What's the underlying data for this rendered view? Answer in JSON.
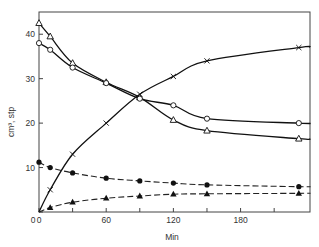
{
  "chart_data": {
    "type": "line",
    "title": "",
    "xlabel": "Min",
    "ylabel": "cm³, stp",
    "xlim": [
      0,
      242
    ],
    "ylim": [
      0,
      45
    ],
    "x_ticks": [
      0,
      30,
      60,
      90,
      120,
      150,
      180,
      210
    ],
    "x_tick_labels": [
      "0",
      "",
      "60",
      "",
      "120",
      "",
      "180",
      ""
    ],
    "y_ticks": [
      0,
      10,
      20,
      30,
      40
    ],
    "y_tick_labels": [
      "",
      "10",
      "20",
      "30",
      "40"
    ],
    "grid": false,
    "legend": null,
    "series": [
      {
        "name": "open-triangle",
        "marker": "triangle-open",
        "line": "solid",
        "x": [
          0,
          10,
          30,
          60,
          90,
          120,
          150,
          232
        ],
        "values": [
          42.5,
          39.5,
          33.5,
          29.2,
          25.8,
          20.7,
          18.3,
          16.5
        ]
      },
      {
        "name": "open-circle",
        "marker": "circle-open",
        "line": "solid",
        "x": [
          0,
          10,
          30,
          60,
          90,
          120,
          150,
          232
        ],
        "values": [
          38.0,
          36.5,
          32.5,
          29.0,
          25.5,
          24.0,
          21.0,
          20.0
        ]
      },
      {
        "name": "cross",
        "marker": "x",
        "line": "solid",
        "x": [
          0,
          10,
          30,
          60,
          90,
          120,
          150,
          232
        ],
        "values": [
          0,
          5.0,
          13.0,
          20.0,
          26.5,
          30.5,
          34.0,
          37.0
        ]
      },
      {
        "name": "filled-circle",
        "marker": "circle-filled",
        "line": "dashed",
        "x": [
          0,
          10,
          30,
          60,
          90,
          120,
          150,
          232
        ],
        "values": [
          11.2,
          10.0,
          8.8,
          7.6,
          7.0,
          6.5,
          6.1,
          5.7
        ]
      },
      {
        "name": "filled-triangle",
        "marker": "triangle-filled",
        "line": "dashed",
        "x": [
          0,
          10,
          30,
          60,
          90,
          120,
          150,
          232
        ],
        "values": [
          0,
          1.0,
          2.2,
          3.1,
          3.6,
          4.0,
          4.1,
          4.2
        ]
      }
    ]
  }
}
